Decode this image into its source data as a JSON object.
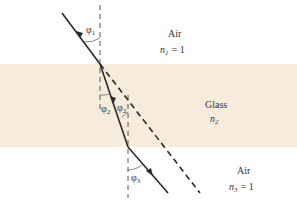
{
  "figure": {
    "type": "refraction-through-glass-slab",
    "colors": {
      "glass": "#f7ecdc",
      "air": "#ffffff",
      "ray": "#2a2a2a",
      "normal": "#555555"
    },
    "regions": [
      {
        "name": "Air",
        "index_label": "n",
        "index_sub": "1",
        "index_value": "= 1"
      },
      {
        "name": "Glass",
        "index_label": "n",
        "index_sub": "2",
        "index_value": ""
      },
      {
        "name": "Air",
        "index_label": "n",
        "index_sub": "3",
        "index_value": "= 1"
      }
    ],
    "angles": [
      {
        "symbol": "φ",
        "sub": "1"
      },
      {
        "symbol": "φ",
        "sub": "2"
      },
      {
        "symbol": "φ",
        "sub": "2"
      },
      {
        "symbol": "φ",
        "sub": "3"
      }
    ]
  }
}
